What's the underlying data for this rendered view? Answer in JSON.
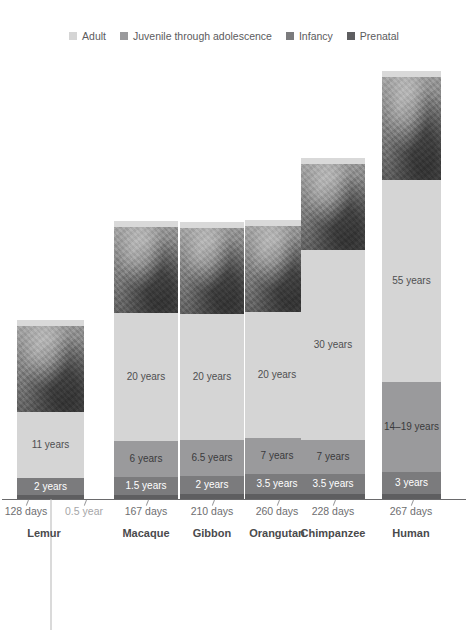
{
  "legend": {
    "items": [
      {
        "label": "Adult",
        "color": "#d5d5d5",
        "key": "adult"
      },
      {
        "label": "Juvenile through adolescence",
        "color": "#9a9a9c",
        "key": "juvenile"
      },
      {
        "label": "Infancy",
        "color": "#7b7b7d",
        "key": "infancy"
      },
      {
        "label": "Prenatal",
        "color": "#5e5e60",
        "key": "prenatal"
      }
    ]
  },
  "chart_data": {
    "type": "bar",
    "subtype": "stacked-bar",
    "title": "",
    "xlabel": "",
    "ylabel": "",
    "orientation": "vertical",
    "grid": false,
    "legend_position": "top",
    "categories": [
      "Lemur",
      "Macaque",
      "Gibbon",
      "Orangutan",
      "Chimpanzee",
      "Human"
    ],
    "stack_order_bottom_to_top": [
      "Prenatal",
      "Infancy",
      "Juvenile through adolescence",
      "Adult"
    ],
    "series": [
      {
        "name": "Prenatal",
        "unit": "days",
        "values": [
          128,
          167,
          210,
          260,
          228,
          267
        ],
        "labels": [
          "128 days",
          "167 days",
          "210 days",
          "260 days",
          "228 days",
          "267 days"
        ]
      },
      {
        "name": "Infancy",
        "unit": "years",
        "values": [
          2,
          1.5,
          2,
          3.5,
          3.5,
          3
        ],
        "labels": [
          "2 years",
          "1.5 years",
          "2 years",
          "3.5 years",
          "3.5 years",
          "3 years"
        ]
      },
      {
        "name": "Juvenile through adolescence",
        "unit": "years",
        "values": [
          11,
          6,
          6.5,
          7,
          7,
          16.5
        ],
        "labels": [
          "11 years",
          "6 years",
          "6.5 years",
          "7 years",
          "7 years",
          "14–19 years"
        ]
      },
      {
        "name": "Adult",
        "unit": "years",
        "values": [
          null,
          20,
          20,
          20,
          30,
          55
        ],
        "labels": [
          "",
          "20 years",
          "20 years",
          "20 years",
          "30 years",
          "55 years"
        ]
      }
    ],
    "extra_ticks": [
      {
        "category": "Lemur",
        "label": "0.5 year"
      }
    ],
    "annotations": [
      "Each column shows a primate life span broken into prenatal, infancy, juvenile-through-adolescence and adult stages.",
      "A photograph of each species sits at the top of its column."
    ]
  },
  "columns": [
    {
      "key": "lemur",
      "name": "Lemur",
      "photo_alt": "ring-tailed-lemur-photo",
      "segments": [
        {
          "stage": "adult",
          "label": "11 years",
          "class": "seg-adult",
          "h": 66
        },
        {
          "stage": "infancy",
          "label": "2 years",
          "class": "seg-inf",
          "h": 17
        },
        {
          "stage": "prenatal",
          "label": "",
          "class": "seg-pre",
          "h": 4
        }
      ],
      "day_label": "128 days",
      "extra_label": "0.5 year"
    },
    {
      "key": "macaque",
      "name": "Macaque",
      "photo_alt": "macaque-photo",
      "segments": [
        {
          "stage": "adult",
          "label": "20 years",
          "class": "seg-adult",
          "h": 128
        },
        {
          "stage": "juvenile",
          "label": "6 years",
          "class": "seg-juv",
          "h": 36
        },
        {
          "stage": "infancy",
          "label": "1.5 years",
          "class": "seg-inf",
          "h": 18
        },
        {
          "stage": "prenatal",
          "label": "",
          "class": "seg-pre",
          "h": 4
        }
      ],
      "day_label": "167 days",
      "extra_label": ""
    },
    {
      "key": "gibbon",
      "name": "Gibbon",
      "photo_alt": "gibbon-photo",
      "segments": [
        {
          "stage": "adult",
          "label": "20 years",
          "class": "seg-adult",
          "h": 126
        },
        {
          "stage": "juvenile",
          "label": "6.5 years",
          "class": "seg-juv",
          "h": 36
        },
        {
          "stage": "infancy",
          "label": "2 years",
          "class": "seg-inf",
          "h": 18
        },
        {
          "stage": "prenatal",
          "label": "",
          "class": "seg-pre",
          "h": 5
        }
      ],
      "day_label": "210 days",
      "extra_label": ""
    },
    {
      "key": "orangutan",
      "name": "Orangutan",
      "photo_alt": "orangutan-photo",
      "segments": [
        {
          "stage": "adult",
          "label": "20 years",
          "class": "seg-adult",
          "h": 126
        },
        {
          "stage": "juvenile",
          "label": "7 years",
          "class": "seg-juv",
          "h": 36
        },
        {
          "stage": "infancy",
          "label": "3.5 years",
          "class": "seg-inf",
          "h": 20
        },
        {
          "stage": "prenatal",
          "label": "",
          "class": "seg-pre",
          "h": 5
        }
      ],
      "day_label": "260 days",
      "extra_label": ""
    },
    {
      "key": "chimpanzee",
      "name": "Chimpanzee",
      "photo_alt": "chimpanzee-photo",
      "segments": [
        {
          "stage": "adult",
          "label": "30 years",
          "class": "seg-adult",
          "h": 190
        },
        {
          "stage": "juvenile",
          "label": "7 years",
          "class": "seg-juv",
          "h": 34
        },
        {
          "stage": "infancy",
          "label": "3.5 years",
          "class": "seg-inf",
          "h": 20
        },
        {
          "stage": "prenatal",
          "label": "",
          "class": "seg-pre",
          "h": 5
        }
      ],
      "day_label": "228 days",
      "extra_label": ""
    },
    {
      "key": "human",
      "name": "Human",
      "photo_alt": "human-photo",
      "segments": [
        {
          "stage": "adult",
          "label": "55 years",
          "class": "seg-adult",
          "h": 202
        },
        {
          "stage": "juvenile",
          "label": "14–19 years",
          "class": "seg-juv",
          "h": 90
        },
        {
          "stage": "infancy",
          "label": "3 years",
          "class": "seg-inf",
          "h": 22
        },
        {
          "stage": "prenatal",
          "label": "",
          "class": "seg-pre",
          "h": 5
        }
      ],
      "day_label": "267 days",
      "extra_label": ""
    }
  ],
  "geometry": {
    "columns": [
      {
        "key": "lemur",
        "left": 17,
        "width": 67,
        "photo_h": 86,
        "photo_top": 310,
        "leader_top": 0,
        "center": 44
      },
      {
        "key": "macaque",
        "left": 114,
        "width": 64,
        "photo_h": 86,
        "photo_top": 232,
        "leader_top": 0,
        "center": 146
      },
      {
        "key": "gibbon",
        "left": 180,
        "width": 64,
        "photo_h": 86,
        "photo_top": 239,
        "leader_top": 0,
        "center": 212
      },
      {
        "key": "orangutan",
        "left": 245,
        "width": 64,
        "photo_h": 86,
        "photo_top": 213,
        "leader_top": 0,
        "center": 277
      },
      {
        "key": "chimpanzee",
        "left": 301,
        "width": 64,
        "photo_h": 86,
        "photo_top": 162,
        "leader_top": 0,
        "center": 333
      },
      {
        "key": "human",
        "left": 382,
        "width": 59,
        "photo_h": 103,
        "photo_top": 58,
        "leader_top": 0,
        "center": 411
      }
    ],
    "day_label_x": [
      44,
      212,
      277,
      333,
      411
    ],
    "lemur_day_x": 26,
    "lemur_extra_x": 84
  }
}
